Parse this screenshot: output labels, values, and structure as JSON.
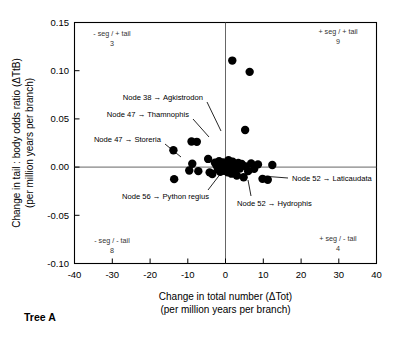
{
  "figure": {
    "caption": "Tree A"
  },
  "chart_data": {
    "type": "scatter",
    "title": "",
    "xlabel_line1": "Change in total number (ΔTot)",
    "xlabel_line2": "(per million years per branch)",
    "ylabel_line1": "Change in tail : body odds ratio (ΔTtB)",
    "ylabel_line2": "(per million years per branch)",
    "xlim": [
      -40,
      40
    ],
    "ylim": [
      -0.1,
      0.15
    ],
    "grid": false,
    "legend": "none",
    "xticks": [
      -40,
      -30,
      -20,
      -10,
      0,
      10,
      20,
      30,
      40
    ],
    "xticklabels": [
      "-40",
      "-30",
      "-20",
      "-10",
      "0",
      "10",
      "20",
      "30",
      "40"
    ],
    "yticks": [
      0.15,
      0.1,
      0.05,
      0.0,
      -0.05,
      -0.1
    ],
    "yticklabels": [
      "0.15",
      "0.10",
      "0.05",
      "0.00",
      "-0.05",
      "-0.10"
    ],
    "zero_lines": {
      "x": 0,
      "y": 0
    },
    "marker": {
      "shape": "circle",
      "color": "#000000",
      "size": 5.2
    },
    "points": [
      {
        "x": -13.8,
        "y": 0.0175
      },
      {
        "x": -9.0,
        "y": 0.0265
      },
      {
        "x": -7.6,
        "y": 0.0262
      },
      {
        "x": -8.8,
        "y": 0.0035
      },
      {
        "x": -9.6,
        "y": -0.0035
      },
      {
        "x": -7.2,
        "y": -0.0042
      },
      {
        "x": -13.6,
        "y": -0.0125
      },
      {
        "x": -4.6,
        "y": 0.0085
      },
      {
        "x": -4.2,
        "y": -0.0055
      },
      {
        "x": -3.5,
        "y": -0.0072
      },
      {
        "x": -2.8,
        "y": 0.0045
      },
      {
        "x": -2.4,
        "y": 0.0018
      },
      {
        "x": -2.0,
        "y": -0.0022
      },
      {
        "x": -1.7,
        "y": 0.0062
      },
      {
        "x": -1.4,
        "y": -0.0048
      },
      {
        "x": -1.1,
        "y": 0.0028
      },
      {
        "x": -0.9,
        "y": -0.0012
      },
      {
        "x": -0.6,
        "y": 0.0048
      },
      {
        "x": -0.4,
        "y": -0.0038
      },
      {
        "x": -0.2,
        "y": 0.0012
      },
      {
        "x": 0.0,
        "y": -0.0025
      },
      {
        "x": 0.2,
        "y": 0.0038
      },
      {
        "x": 0.4,
        "y": 0.0005
      },
      {
        "x": 0.6,
        "y": -0.0055
      },
      {
        "x": 0.8,
        "y": 0.0072
      },
      {
        "x": 1.0,
        "y": -0.0018
      },
      {
        "x": 1.3,
        "y": 0.0022
      },
      {
        "x": 1.6,
        "y": -0.0068
      },
      {
        "x": 1.9,
        "y": 0.0055
      },
      {
        "x": 2.2,
        "y": -0.0032
      },
      {
        "x": 2.6,
        "y": 0.0015
      },
      {
        "x": 3.0,
        "y": -0.0088
      },
      {
        "x": 3.4,
        "y": 0.0042
      },
      {
        "x": 3.8,
        "y": -0.0015
      },
      {
        "x": 4.3,
        "y": 0.0032
      },
      {
        "x": 4.8,
        "y": -0.0105
      },
      {
        "x": 5.4,
        "y": 0.0008
      },
      {
        "x": 6.0,
        "y": -0.0042
      },
      {
        "x": 6.8,
        "y": 0.0038
      },
      {
        "x": 7.6,
        "y": -0.0018
      },
      {
        "x": 8.6,
        "y": 0.0028
      },
      {
        "x": 9.8,
        "y": -0.0122
      },
      {
        "x": 11.2,
        "y": -0.0132
      },
      {
        "x": 12.4,
        "y": 0.0022
      },
      {
        "x": 5.2,
        "y": 0.0385
      },
      {
        "x": 1.8,
        "y": 0.1105
      },
      {
        "x": 6.4,
        "y": 0.0988
      }
    ],
    "quadrants": [
      {
        "id": "top-left",
        "label": "- seg / + tail",
        "count": "3"
      },
      {
        "id": "top-right",
        "label": "+ seg / + tail",
        "count": "9"
      },
      {
        "id": "bottom-left",
        "label": "- seg / - tail",
        "count": "8"
      },
      {
        "id": "bottom-right",
        "label": "+ seg / - tail",
        "count": "4"
      }
    ],
    "annotations": [
      {
        "id": "agkistrodon",
        "text": "Node 38 → Agkistrodon"
      },
      {
        "id": "thamnophis",
        "text": "Node 47 → Thamnophis"
      },
      {
        "id": "storeria",
        "text": "Node 47 → Storeria"
      },
      {
        "id": "python",
        "text": "Node 56 → Python regius"
      },
      {
        "id": "laticaudata",
        "text": "Node 52 → Laticaudata"
      },
      {
        "id": "hydrophis",
        "text": "Node 52 → Hydrophis"
      }
    ]
  }
}
